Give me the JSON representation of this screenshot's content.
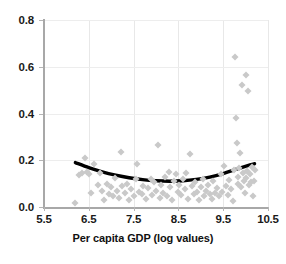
{
  "chart_data": {
    "type": "scatter",
    "title": "",
    "xlabel": "Per capita GDP (log values)",
    "ylabel": "",
    "xlim": [
      5.5,
      10.5
    ],
    "ylim": [
      0.0,
      0.8
    ],
    "grid": true,
    "legend": "none",
    "x_ticks": [
      "5.5",
      "6.5",
      "7.5",
      "8.5",
      "9.5",
      "10.5"
    ],
    "x_tick_values": [
      5.5,
      6.5,
      7.5,
      8.5,
      9.5,
      10.5
    ],
    "y_ticks": [
      "0.0",
      "0.2",
      "0.4",
      "0.6",
      "0.8"
    ],
    "y_tick_values": [
      0.0,
      0.2,
      0.4,
      0.6,
      0.8
    ],
    "marker": "diamond",
    "marker_color": "#c9c9c9",
    "points": [
      [
        6.2,
        0.015
      ],
      [
        6.28,
        0.135
      ],
      [
        6.35,
        0.145
      ],
      [
        6.42,
        0.21
      ],
      [
        6.45,
        0.15
      ],
      [
        6.5,
        0.14
      ],
      [
        6.55,
        0.06
      ],
      [
        6.62,
        0.185
      ],
      [
        6.7,
        0.095
      ],
      [
        6.75,
        0.145
      ],
      [
        6.8,
        0.07
      ],
      [
        6.85,
        0.03
      ],
      [
        6.9,
        0.1
      ],
      [
        6.95,
        0.055
      ],
      [
        7.0,
        0.085
      ],
      [
        7.05,
        0.045
      ],
      [
        7.08,
        0.125
      ],
      [
        7.12,
        0.07
      ],
      [
        7.18,
        0.04
      ],
      [
        7.22,
        0.235
      ],
      [
        7.25,
        0.09
      ],
      [
        7.3,
        0.06
      ],
      [
        7.35,
        0.1
      ],
      [
        7.4,
        0.03
      ],
      [
        7.45,
        0.075
      ],
      [
        7.5,
        0.045
      ],
      [
        7.55,
        0.12
      ],
      [
        7.58,
        0.185
      ],
      [
        7.62,
        0.065
      ],
      [
        7.68,
        0.055
      ],
      [
        7.72,
        0.09
      ],
      [
        7.78,
        0.035
      ],
      [
        7.82,
        0.08
      ],
      [
        7.88,
        0.12
      ],
      [
        7.92,
        0.05
      ],
      [
        7.96,
        0.105
      ],
      [
        8.0,
        0.07
      ],
      [
        8.04,
        0.265
      ],
      [
        8.08,
        0.04
      ],
      [
        8.12,
        0.095
      ],
      [
        8.16,
        0.06
      ],
      [
        8.2,
        0.13
      ],
      [
        8.24,
        0.045
      ],
      [
        8.28,
        0.15
      ],
      [
        8.32,
        0.085
      ],
      [
        8.36,
        0.03
      ],
      [
        8.4,
        0.11
      ],
      [
        8.44,
        0.14
      ],
      [
        8.48,
        0.065
      ],
      [
        8.52,
        0.095
      ],
      [
        8.56,
        0.05
      ],
      [
        8.6,
        0.12
      ],
      [
        8.64,
        0.075
      ],
      [
        8.68,
        0.145
      ],
      [
        8.72,
        0.035
      ],
      [
        8.76,
        0.225
      ],
      [
        8.8,
        0.09
      ],
      [
        8.84,
        0.055
      ],
      [
        8.88,
        0.105
      ],
      [
        8.92,
        0.065
      ],
      [
        8.96,
        0.03
      ],
      [
        9.0,
        0.085
      ],
      [
        9.04,
        0.12
      ],
      [
        9.08,
        0.045
      ],
      [
        9.12,
        0.07
      ],
      [
        9.16,
        0.095
      ],
      [
        9.2,
        0.055
      ],
      [
        9.24,
        0.035
      ],
      [
        9.28,
        0.11
      ],
      [
        9.32,
        0.06
      ],
      [
        9.36,
        0.08
      ],
      [
        9.4,
        0.045
      ],
      [
        9.44,
        0.14
      ],
      [
        9.48,
        0.065
      ],
      [
        9.52,
        0.175
      ],
      [
        9.56,
        0.09
      ],
      [
        9.6,
        0.05
      ],
      [
        9.64,
        0.115
      ],
      [
        9.68,
        0.075
      ],
      [
        9.72,
        0.025
      ],
      [
        9.74,
        0.16
      ],
      [
        9.76,
        0.64
      ],
      [
        9.78,
        0.38
      ],
      [
        9.8,
        0.275
      ],
      [
        9.82,
        0.13
      ],
      [
        9.84,
        0.1
      ],
      [
        9.86,
        0.165
      ],
      [
        9.88,
        0.23
      ],
      [
        9.9,
        0.085
      ],
      [
        9.92,
        0.52
      ],
      [
        9.94,
        0.145
      ],
      [
        9.96,
        0.11
      ],
      [
        9.98,
        0.06
      ],
      [
        10.0,
        0.565
      ],
      [
        10.02,
        0.125
      ],
      [
        10.04,
        0.155
      ],
      [
        10.06,
        0.495
      ],
      [
        10.08,
        0.095
      ],
      [
        10.1,
        0.14
      ],
      [
        10.12,
        0.105
      ],
      [
        10.14,
        0.17
      ],
      [
        10.16,
        0.045
      ],
      [
        10.18,
        0.11
      ],
      [
        10.2,
        0.16
      ]
    ],
    "trend": {
      "name": "quadratic fit",
      "color": "#000000",
      "points": [
        [
          6.2,
          0.19
        ],
        [
          6.5,
          0.168
        ],
        [
          6.8,
          0.15
        ],
        [
          7.1,
          0.136
        ],
        [
          7.4,
          0.125
        ],
        [
          7.7,
          0.117
        ],
        [
          8.0,
          0.112
        ],
        [
          8.3,
          0.11
        ],
        [
          8.6,
          0.112
        ],
        [
          8.9,
          0.118
        ],
        [
          9.2,
          0.128
        ],
        [
          9.5,
          0.143
        ],
        [
          9.8,
          0.162
        ],
        [
          10.1,
          0.18
        ],
        [
          10.2,
          0.185
        ]
      ]
    }
  }
}
